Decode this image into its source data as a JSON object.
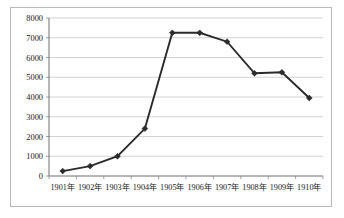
{
  "chart_data": {
    "type": "line",
    "title": "",
    "subtitle": "",
    "xlabel": "",
    "ylabel": "",
    "categories": [
      "1901年",
      "1902年",
      "1903年",
      "1904年",
      "1905年",
      "1906年",
      "1907年",
      "1908年",
      "1909年",
      "1910年"
    ],
    "values": [
      250,
      500,
      1000,
      2400,
      7250,
      7250,
      6800,
      5200,
      5250,
      3950
    ],
    "series": [
      {
        "name": "",
        "values": [
          250,
          500,
          1000,
          2400,
          7250,
          7250,
          6800,
          5200,
          5250,
          3950
        ]
      }
    ],
    "ylim": [
      0,
      8000
    ],
    "ytick_labels": [
      "0",
      "1000",
      "2000",
      "3000",
      "4000",
      "5000",
      "6000",
      "7000",
      "8000"
    ],
    "ytick_values": [
      0,
      1000,
      2000,
      3000,
      4000,
      5000,
      6000,
      7000,
      8000
    ],
    "grid": true,
    "grid_axis": "y",
    "legend": false,
    "legend_position": "none",
    "marker": "diamond",
    "line_color": "#2b2b2b",
    "grid_color": "#bfbfbf",
    "axis_color": "#6f6f6f",
    "background_color": "#ffffff",
    "border_color": "#b9b9b9",
    "annotations": []
  }
}
